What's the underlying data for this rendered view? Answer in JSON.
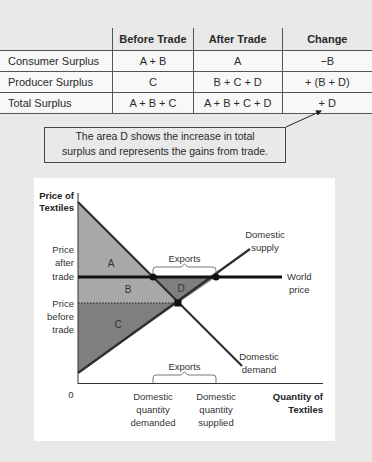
{
  "table": {
    "headers": [
      "",
      "Before Trade",
      "After Trade",
      "Change"
    ],
    "rows": [
      {
        "label": "Consumer Surplus",
        "before": "A + B",
        "after": "A",
        "change": "−B"
      },
      {
        "label": "Producer Surplus",
        "before": "C",
        "after": "B + C + D",
        "change": "+ (B + D)"
      },
      {
        "label": "Total Surplus",
        "before": "A + B + C",
        "after": "A + B + C + D",
        "change": "+ D"
      }
    ]
  },
  "callout": {
    "line1": "The area D shows the increase in total",
    "line2": "surplus and represents the gains from trade."
  },
  "graph": {
    "y_axis_label": [
      "Price of",
      "Textiles"
    ],
    "x_axis_label": [
      "Quantity of",
      "Textiles"
    ],
    "origin_label": "0",
    "price_after_trade": [
      "Price",
      "after",
      "trade"
    ],
    "price_before_trade": [
      "Price",
      "before",
      "trade"
    ],
    "supply_label": [
      "Domestic",
      "supply"
    ],
    "demand_label": [
      "Domestic",
      "demand"
    ],
    "world_price_label": [
      "World",
      "price"
    ],
    "exports_label": "Exports",
    "qty_demanded_label": [
      "Domestic",
      "quantity",
      "demanded"
    ],
    "qty_supplied_label": [
      "Domestic",
      "quantity",
      "supplied"
    ],
    "areas": {
      "A": "A",
      "B": "B",
      "C": "C",
      "D": "D"
    },
    "colors": {
      "light_area": "#a8a8a8",
      "dark_area": "#7f7f7f",
      "line": "#2e2e2e",
      "world_price": "#111111"
    }
  }
}
